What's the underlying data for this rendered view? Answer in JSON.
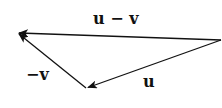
{
  "diagram": {
    "type": "vector-triangle",
    "vectors": [
      {
        "name": "u",
        "label": "u",
        "from": [
          221,
          40
        ],
        "to": [
          87,
          88
        ]
      },
      {
        "name": "neg-v",
        "label": "−v",
        "from": [
          87,
          88
        ],
        "to": [
          18,
          33
        ]
      },
      {
        "name": "u-minus-v",
        "label": "u − v",
        "from": [
          221,
          40
        ],
        "to": [
          18,
          33
        ]
      }
    ],
    "stroke_color": "#111111"
  }
}
